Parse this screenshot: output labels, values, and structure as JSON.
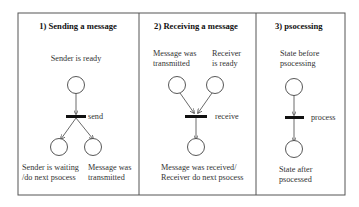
{
  "panels": [
    {
      "title": "1) Sending a message",
      "places": {
        "top": "Sender is ready",
        "bottom_left_line1": "Sender is waiting",
        "bottom_left_line2": "/do next psocess",
        "bottom_right_line1": "Message was",
        "bottom_right_line2": "transmitted"
      },
      "transition": "send"
    },
    {
      "title": "2) Receiving a message",
      "places": {
        "top_left_line1": "Message was",
        "top_left_line2": "transmitted",
        "top_right_line1": "Receiver",
        "top_right_line2": "is ready",
        "bottom_line1": "Message was received/",
        "bottom_line2": "Receiver do next psocess"
      },
      "transition": "receive"
    },
    {
      "title": "3) psocessing",
      "places": {
        "top_line1": "State before",
        "top_line2": "psocessing",
        "bottom_line1": "State after",
        "bottom_line2": "psocessed"
      },
      "transition": "process"
    }
  ],
  "colors": {
    "stroke": "#333333",
    "frame": "#555555",
    "background": "#ffffff"
  }
}
